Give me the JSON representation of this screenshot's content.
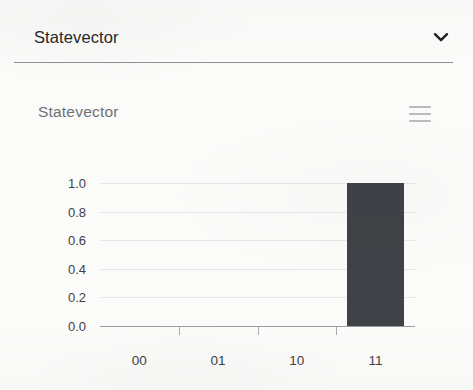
{
  "selector": {
    "label": "Statevector",
    "icon": "chevron-down-icon"
  },
  "chart_panel": {
    "title": "Statevector",
    "menu_icon": "hamburger-menu-icon"
  },
  "chart_data": {
    "type": "bar",
    "title": "Statevector",
    "categories": [
      "00",
      "01",
      "10",
      "11"
    ],
    "values": [
      0,
      0,
      0,
      1.0
    ],
    "yticks": [
      "1.0",
      "0.8",
      "0.6",
      "0.4",
      "0.2",
      "0.0"
    ],
    "ytick_values": [
      1.0,
      0.8,
      0.6,
      0.4,
      0.2,
      0.0
    ],
    "ylim": [
      0,
      1.0
    ],
    "xlabel": "",
    "ylabel": "",
    "grid": true,
    "legend": "none",
    "bar_color": "#3f4246",
    "series": [
      {
        "name": "Statevector",
        "values": [
          0,
          0,
          0,
          1.0
        ]
      }
    ]
  },
  "colors": {
    "page_background": "#fbfbfa",
    "divider": "#8e9093",
    "text_primary": "#26282b",
    "text_muted": "#6e7175",
    "axis": "#9b9ea1",
    "bar": "#3f4246",
    "menu_icon": "#b9bcbf"
  }
}
